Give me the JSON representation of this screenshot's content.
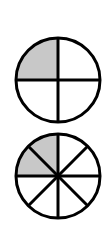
{
  "diagram": {
    "colors": {
      "stroke": "#000000",
      "shaded": "#c8c8c8",
      "unshaded": "#ffffff"
    },
    "circles": [
      {
        "name": "fourths-circle",
        "parts": 4,
        "shaded": 1,
        "fraction": "1/4",
        "cx": 58,
        "cy": 80,
        "r": 42
      },
      {
        "name": "eighths-circle",
        "parts": 8,
        "shaded": 2,
        "fraction": "2/8",
        "cx": 58,
        "cy": 176,
        "r": 42
      }
    ]
  }
}
